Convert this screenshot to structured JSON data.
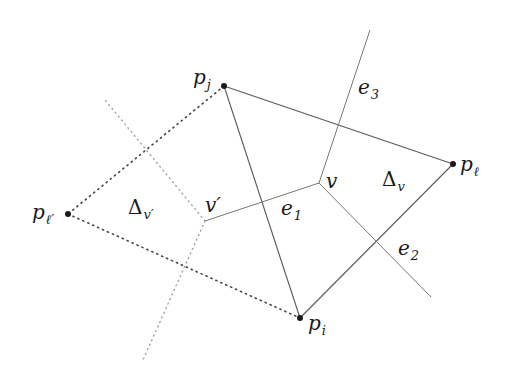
{
  "diagram": {
    "points": {
      "p_j": {
        "label": "p",
        "sub": "j",
        "x": 224,
        "y": 86
      },
      "p_l": {
        "label": "p",
        "sub": "ℓ",
        "x": 453,
        "y": 164
      },
      "p_i": {
        "label": "p",
        "sub": "i",
        "x": 300,
        "y": 318
      },
      "p_lp": {
        "label": "p",
        "sub": "ℓ′",
        "x": 68,
        "y": 214
      }
    },
    "voronoi_vertices": {
      "v": {
        "label": "v",
        "x": 319,
        "y": 183
      },
      "v_prime": {
        "label": "v′",
        "x": 205,
        "y": 221
      }
    },
    "edge_labels": {
      "e1": {
        "label": "e",
        "sub": "1"
      },
      "e2": {
        "label": "e",
        "sub": "2"
      },
      "e3": {
        "label": "e",
        "sub": "3"
      }
    },
    "triangle_labels": {
      "delta_v": {
        "label": "Δ",
        "sub": "v"
      },
      "delta_vp": {
        "label": "Δ",
        "sub": "v′"
      }
    },
    "colors": {
      "solid_line": "#555555",
      "dotted_line": "#555555",
      "light_dotted": "#9a9a9a",
      "point": "#1a1a1a"
    }
  }
}
